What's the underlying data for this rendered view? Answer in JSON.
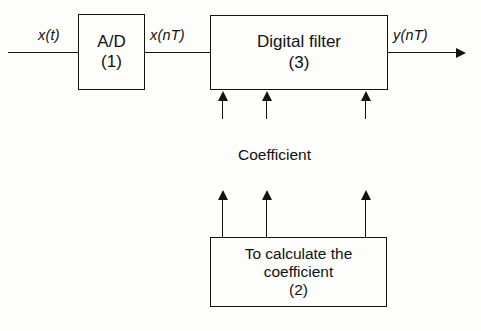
{
  "diagram": {
    "blocks": [
      {
        "id": "ad",
        "lines": [
          "A/D",
          "(1)"
        ],
        "number": "(1)"
      },
      {
        "id": "digital_filter",
        "lines": [
          "Digital filter",
          "(3)"
        ],
        "number": "(3)"
      },
      {
        "id": "calculate_coefficient",
        "lines": [
          "To calculate the",
          "coefficient",
          "(2)"
        ],
        "number": "(2)"
      }
    ],
    "signals": {
      "input": "x(t)",
      "intermediate": "x(nT)",
      "output": "y(nT)"
    },
    "annotations": {
      "coefficient": "Coefficient"
    },
    "colors": {
      "ink": "#15130f",
      "background": "#fdfdfc"
    },
    "coefficient_paths": 3
  }
}
